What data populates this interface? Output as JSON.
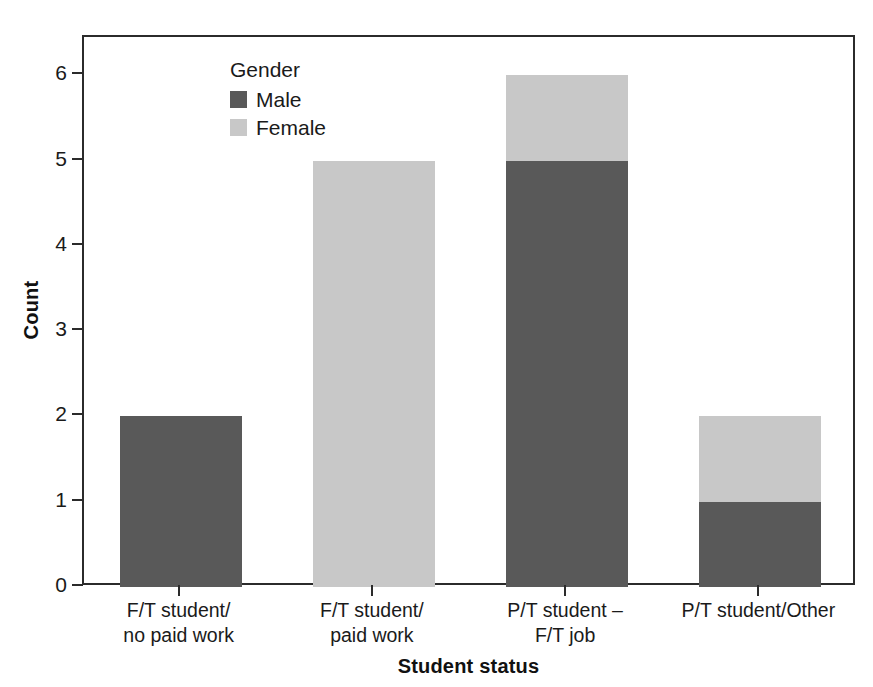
{
  "top_caption": "",
  "chart_data": {
    "type": "bar",
    "subtype": "stacked-bar",
    "title": "",
    "xlabel": "Student status",
    "ylabel": "Count",
    "ylim": [
      0,
      6.45
    ],
    "yticks": [
      0,
      1,
      2,
      3,
      4,
      5,
      6
    ],
    "ytick_labels": [
      "0",
      "1",
      "2",
      "3",
      "4",
      "5",
      "6"
    ],
    "grid": false,
    "categories": [
      "F/T student/\nno paid work",
      "F/T student/\npaid work",
      "P/T student –\nF/T job",
      "P/T student/Other"
    ],
    "category_lines": [
      [
        "F/T student/",
        "no paid work"
      ],
      [
        "F/T student/",
        "paid work"
      ],
      [
        "P/T student –",
        "F/T job"
      ],
      [
        "P/T student/Other",
        ""
      ]
    ],
    "series": [
      {
        "name": "Male",
        "color": "#595959",
        "values": [
          2,
          0,
          5,
          1
        ]
      },
      {
        "name": "Female",
        "color": "#c8c8c8",
        "values": [
          0,
          5,
          1,
          1
        ]
      }
    ],
    "totals": [
      2,
      5,
      6,
      2
    ],
    "legend": {
      "title": "Gender",
      "position": "top-right-inside",
      "entries": [
        {
          "label": "Male",
          "color": "#595959"
        },
        {
          "label": "Female",
          "color": "#c8c8c8"
        }
      ]
    },
    "axis_color": "#2b2b2b",
    "background": "#ffffff"
  }
}
